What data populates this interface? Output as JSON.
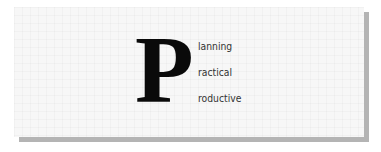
{
  "graphic": {
    "initial_letter": "P",
    "words": [
      {
        "suffix": "lanning",
        "full": "Planning"
      },
      {
        "suffix": "ractical",
        "full": "Practical"
      },
      {
        "suffix": "roductive",
        "full": "Productive"
      }
    ],
    "colors": {
      "card_background": "#f7f7f7",
      "shadow": "#b4b4b4",
      "letter": "#0a0a0a",
      "text": "#333333"
    }
  }
}
